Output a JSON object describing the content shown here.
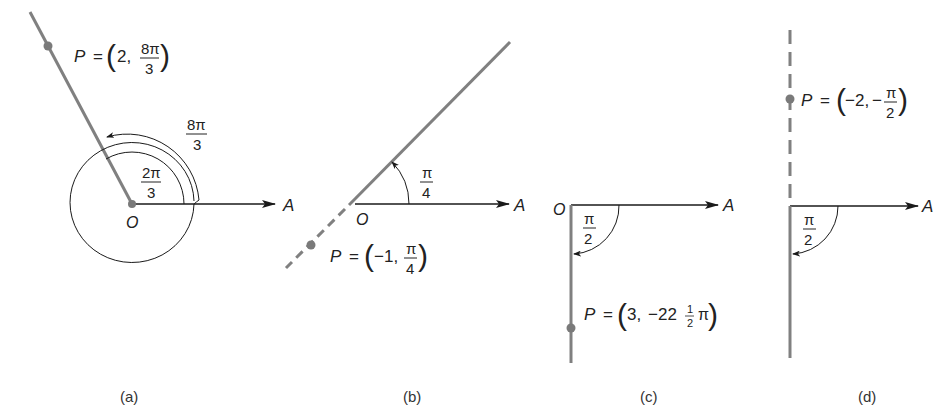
{
  "figure": {
    "colors": {
      "ray": "#808080",
      "axis": "#1a1a1a",
      "text": "#222222",
      "point": "#7a7a7a"
    },
    "panels": [
      {
        "id": "a",
        "caption": "(a)",
        "origin_label": "O",
        "axis_label": "A",
        "point": {
          "name": "P",
          "eq": "=",
          "r": "2,",
          "theta_num": "8π",
          "theta_den": "3"
        },
        "angles": [
          {
            "num": "2π",
            "den": "3"
          },
          {
            "num": "8π",
            "den": "3"
          }
        ]
      },
      {
        "id": "b",
        "caption": "(b)",
        "origin_label": "O",
        "axis_label": "A",
        "point": {
          "name": "P",
          "eq": "=",
          "r": "−1,",
          "theta_num": "π",
          "theta_den": "4"
        },
        "angles": [
          {
            "num": "π",
            "den": "4"
          }
        ]
      },
      {
        "id": "c",
        "caption": "(c)",
        "origin_label": "O",
        "axis_label": "A",
        "point": {
          "name": "P",
          "eq": "=",
          "r": "3,",
          "theta_prefix": "−22",
          "frac_num": "1",
          "frac_den": "2",
          "theta_suffix": "π"
        },
        "angles": [
          {
            "num": "π",
            "den": "2"
          }
        ]
      },
      {
        "id": "d",
        "caption": "(d)",
        "axis_label": "A",
        "point": {
          "name": "P",
          "eq": "=",
          "r": "−2,",
          "sign": "−",
          "theta_num": "π",
          "theta_den": "2"
        },
        "angles": [
          {
            "num": "π",
            "den": "2"
          }
        ]
      }
    ]
  }
}
